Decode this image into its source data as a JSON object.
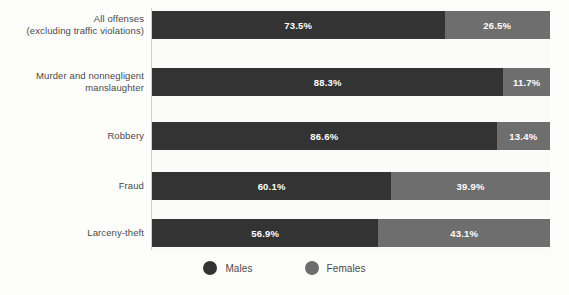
{
  "chart_data": {
    "type": "bar",
    "orientation": "horizontal",
    "stacked": true,
    "normalized_percent": true,
    "title": "",
    "subtitle": "",
    "xlabel": "",
    "ylabel": "",
    "xlim": [
      0,
      100
    ],
    "grid": false,
    "legend_position": "bottom-center",
    "categories": [
      "All offenses\n(excluding traffic violations)",
      "Murder and nonnegligent\nmanslaughter",
      "Robbery",
      "Fraud",
      "Larceny-theft"
    ],
    "series": [
      {
        "name": "Males",
        "color": "#333333",
        "values": [
          73.5,
          88.3,
          86.6,
          60.1,
          56.9
        ],
        "labels": [
          "73.5%",
          "88.3%",
          "86.6%",
          "60.1%",
          "56.9%"
        ]
      },
      {
        "name": "Females",
        "color": "#6e6e6e",
        "values": [
          26.5,
          11.7,
          13.4,
          39.9,
          43.1
        ],
        "labels": [
          "26.5%",
          "11.7%",
          "13.4%",
          "39.9%",
          "43.1%"
        ]
      }
    ]
  },
  "rows": [
    {
      "label_line1": "All offenses",
      "label_line2": "(excluding traffic violations)",
      "male_label": "73.5%",
      "female_label": "26.5%",
      "male_value": 73.5,
      "female_value": 26.5
    },
    {
      "label_line1": "Murder and nonnegligent",
      "label_line2": "manslaughter",
      "male_label": "88.3%",
      "female_label": "11.7%",
      "male_value": 88.3,
      "female_value": 11.7
    },
    {
      "label_line1": "Robbery",
      "label_line2": "",
      "male_label": "86.6%",
      "female_label": "13.4%",
      "male_value": 86.6,
      "female_value": 13.4
    },
    {
      "label_line1": "Fraud",
      "label_line2": "",
      "male_label": "60.1%",
      "female_label": "39.9%",
      "male_value": 60.1,
      "female_value": 39.9
    },
    {
      "label_line1": "Larceny-theft",
      "label_line2": "",
      "male_label": "56.9%",
      "female_label": "43.1%",
      "male_value": 56.9,
      "female_value": 43.1
    }
  ],
  "legend": {
    "items": [
      {
        "label": "Males",
        "color": "#333333",
        "icon": "circle-swatch-icon"
      },
      {
        "label": "Females",
        "color": "#6e6e6e",
        "icon": "circle-swatch-icon"
      }
    ]
  },
  "colors": {
    "male": "#333333",
    "female": "#6e6e6e",
    "plot_background": "#fbfbfa",
    "page_background": "#ffffff",
    "axis_line": "#cfcfcf",
    "label_text": "#4a4a4a",
    "value_text": "#ffffff"
  },
  "layout": {
    "row_tops": [
      11,
      68,
      122,
      172,
      219
    ],
    "bar_height": 28,
    "plot_left": 152,
    "plot_width": 398
  }
}
